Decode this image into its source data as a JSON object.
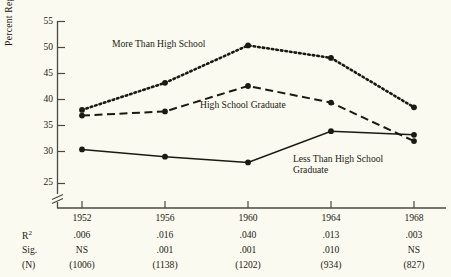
{
  "chart_data": {
    "type": "line",
    "title": "",
    "xlabel": "",
    "ylabel": "Percent Regular Attendance",
    "categories": [
      "1952",
      "1956",
      "1960",
      "1964",
      "1968"
    ],
    "yticks": [
      25,
      30,
      35,
      40,
      45,
      50,
      55
    ],
    "ylim": [
      25,
      55
    ],
    "y_axis_break": true,
    "grid": false,
    "legend_position": "inline-annotations",
    "series": [
      {
        "name": "More Than High School",
        "style": "dotted",
        "marker": "filled-circle",
        "values": [
          38.0,
          43.2,
          50.4,
          48.0,
          38.5
        ]
      },
      {
        "name": "High School Graduate",
        "style": "dashed",
        "marker": "filled-circle",
        "values": [
          36.9,
          37.7,
          42.6,
          39.4,
          32.0
        ]
      },
      {
        "name": "Less Than High School Graduate",
        "style": "solid",
        "marker": "filled-circle",
        "values": [
          30.4,
          29.0,
          27.9,
          33.9,
          33.2
        ]
      }
    ],
    "annotations": [
      {
        "text": "More Than High School",
        "series": "More Than High School"
      },
      {
        "text": "High School Graduate",
        "series": "High School Graduate"
      },
      {
        "text": "Less Than High School",
        "series": "Less Than High School Graduate"
      },
      {
        "text": "Graduate",
        "series": "Less Than High School Graduate"
      }
    ],
    "stats_table": {
      "row_labels": [
        "R²",
        "Sig.",
        "(N)"
      ],
      "r_squared": [
        ".006",
        ".016",
        ".040",
        ".013",
        ".003"
      ],
      "significance": [
        "NS",
        ".001",
        ".001",
        ".010",
        "NS"
      ],
      "n": [
        "(1006)",
        "(1138)",
        "(1202)",
        "(934)",
        "(827)"
      ]
    },
    "colors": {
      "background": "#fbfaf0",
      "ink": "#1a1a14",
      "axis": "#4a4a42"
    }
  }
}
